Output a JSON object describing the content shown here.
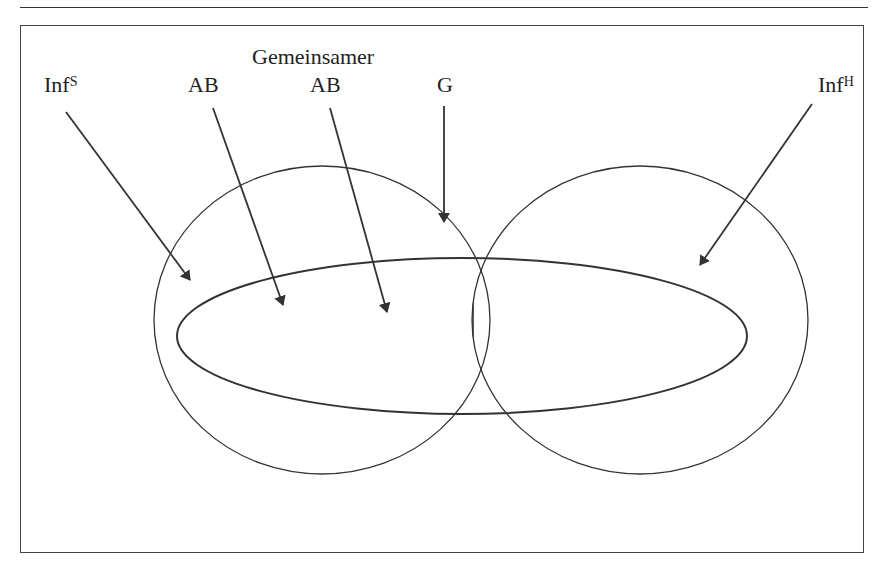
{
  "diagram": {
    "labels": {
      "inf_s": {
        "base": "Inf",
        "sup": "S"
      },
      "ab_left": "AB",
      "gemeinsamer": "Gemeinsamer",
      "ab_common": "AB",
      "g": "G",
      "inf_h": {
        "base": "Inf",
        "sup": "H"
      }
    },
    "shapes": [
      {
        "name": "information-set-S",
        "type": "ellipse",
        "cx": 322,
        "cy": 320,
        "rx": 168,
        "ry": 154
      },
      {
        "name": "information-set-H",
        "type": "ellipse",
        "cx": 640,
        "cy": 320,
        "rx": 168,
        "ry": 154
      },
      {
        "name": "AB-area",
        "type": "ellipse",
        "cx": 462,
        "cy": 336,
        "rx": 285,
        "ry": 78
      },
      {
        "name": "G-common-ground",
        "type": "hatched-lens",
        "hatch": "vertical"
      }
    ],
    "colors": {
      "line": "#333333",
      "background": "#ffffff"
    }
  }
}
